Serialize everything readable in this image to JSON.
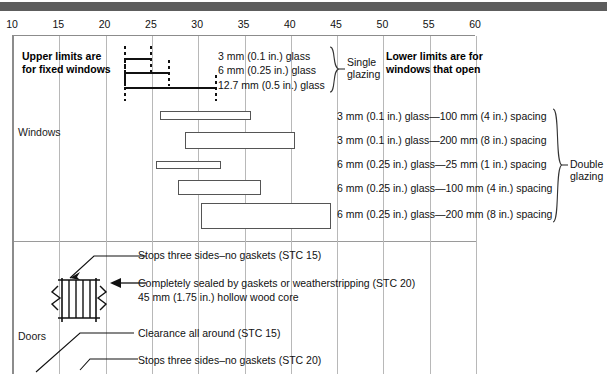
{
  "figure": {
    "axis": {
      "ticks": [
        10,
        15,
        20,
        25,
        30,
        35,
        40,
        45,
        50,
        55,
        60
      ],
      "min": 10,
      "max": 60
    },
    "sections": [
      {
        "label": "Windows"
      },
      {
        "label": "Doors"
      }
    ],
    "notes": {
      "upper_limits": "Upper limits are\nfor fixed windows",
      "upper_limits_line1": "Upper limits are",
      "upper_limits_line2": "for fixed windows",
      "lower_limits_line1": "Lower limits are for",
      "lower_limits_line2": "windows that open"
    },
    "groups": {
      "single_glazing_line1": "Single",
      "single_glazing_line2": "glazing",
      "double_glazing_line1": "Double",
      "double_glazing_line2": "glazing"
    },
    "single_glazing": [
      {
        "label": "3 mm (0.1 in.) glass",
        "start": 22.2,
        "end": 25.0
      },
      {
        "label": "6 mm (0.25 in.) glass",
        "start": 22.2,
        "end": 27.0
      },
      {
        "label": "12.7 mm (0.5 in.) glass",
        "start": 22.2,
        "end": 32.0
      }
    ],
    "double_glazing": [
      {
        "label": "3 mm (0.1 in.) glass—100 mm (4 in.) spacing",
        "start": 26.0,
        "end": 35.8
      },
      {
        "label": "3 mm (0.1 in.) glass—200 mm (8 in.) spacing",
        "start": 28.7,
        "end": 40.6
      },
      {
        "label": "6 mm (0.25 in.) glass—25 mm (1 in.) spacing",
        "start": 25.5,
        "end": 32.6
      },
      {
        "label": "6 mm (0.25 in.) glass—100 mm (4 in.) spacing",
        "start": 27.9,
        "end": 36.9
      },
      {
        "label": "6 mm (0.25 in.) glass—200 mm (8 in.) spacing",
        "start": 30.4,
        "end": 44.5
      }
    ],
    "door_annotations": [
      "Stops three sides–no gaskets (STC 15)",
      "Completely sealed by gaskets or weatherstripping (STC 20)",
      "45 mm (1.75 in.) hollow wood core",
      "Clearance all around (STC 15)",
      "Stops three sides–no gaskets (STC 20)"
    ]
  },
  "chart_data": {
    "type": "bar",
    "xlabel": "Sound transmission class (STC)",
    "ylabel": "",
    "xlim": [
      10,
      60
    ],
    "xticks": [
      10,
      15,
      20,
      25,
      30,
      35,
      40,
      45,
      50,
      55,
      60
    ],
    "grid": true,
    "legend": "none",
    "orientation": "horizontal",
    "series": [
      {
        "name": "Single glazing",
        "style": "thin-line-dotted-ends",
        "items": [
          {
            "category": "3 mm (0.1 in.) glass",
            "low": 22.2,
            "high": 25.0
          },
          {
            "category": "6 mm (0.25 in.) glass",
            "low": 22.2,
            "high": 27.0
          },
          {
            "category": "12.7 mm (0.5 in.) glass",
            "low": 22.2,
            "high": 32.0
          }
        ]
      },
      {
        "name": "Double glazing",
        "style": "open-rectangle",
        "items": [
          {
            "category": "3 mm (0.1 in.) glass—100 mm (4 in.) spacing",
            "low": 26.0,
            "high": 35.8
          },
          {
            "category": "3 mm (0.1 in.) glass—200 mm (8 in.) spacing",
            "low": 28.7,
            "high": 40.6
          },
          {
            "category": "6 mm (0.25 in.) glass—25 mm (1 in.) spacing",
            "low": 25.5,
            "high": 32.6
          },
          {
            "category": "6 mm (0.25 in.) glass—100 mm (4 in.) spacing",
            "low": 27.9,
            "high": 36.9
          },
          {
            "category": "6 mm (0.25 in.) glass—200 mm (8 in.) spacing",
            "low": 30.4,
            "high": 44.5
          }
        ]
      },
      {
        "name": "Doors",
        "style": "annotation",
        "items": [
          {
            "category": "45 mm (1.75 in.) hollow wood core, stops three sides–no gaskets",
            "value": 15
          },
          {
            "category": "45 mm (1.75 in.) hollow wood core, completely sealed by gaskets or weatherstripping",
            "value": 20
          },
          {
            "category": "Clearance all around",
            "value": 15
          },
          {
            "category": "Stops three sides–no gaskets",
            "value": 20
          }
        ]
      }
    ]
  }
}
